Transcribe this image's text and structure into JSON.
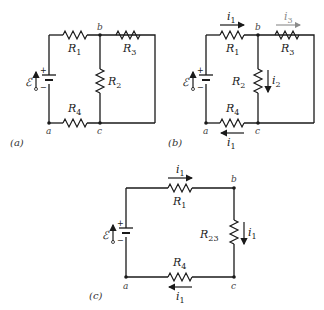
{
  "figures": [
    {
      "caption": "(a)",
      "nodes": [
        "a",
        "b",
        "c"
      ],
      "emf_label": "ℰ",
      "battery_signs": [
        "+",
        "−"
      ],
      "resistors": [
        {
          "name": "R",
          "sub": "1"
        },
        {
          "name": "R",
          "sub": "2"
        },
        {
          "name": "R",
          "sub": "3"
        },
        {
          "name": "R",
          "sub": "4"
        }
      ]
    },
    {
      "caption": "(b)",
      "nodes": [
        "a",
        "b",
        "c"
      ],
      "emf_label": "ℰ",
      "battery_signs": [
        "+",
        "−"
      ],
      "resistors": [
        {
          "name": "R",
          "sub": "1"
        },
        {
          "name": "R",
          "sub": "2"
        },
        {
          "name": "R",
          "sub": "3"
        },
        {
          "name": "R",
          "sub": "4"
        }
      ],
      "currents": [
        {
          "name": "i",
          "sub": "1",
          "location": "through R1, rightward"
        },
        {
          "name": "i",
          "sub": "2",
          "location": "through R2, downward"
        },
        {
          "name": "i",
          "sub": "3",
          "location": "through R3, rightward"
        },
        {
          "name": "i",
          "sub": "1",
          "location": "through R4, leftward"
        }
      ]
    },
    {
      "caption": "(c)",
      "nodes": [
        "a",
        "b",
        "c"
      ],
      "emf_label": "ℰ",
      "battery_signs": [
        "+",
        "−"
      ],
      "resistors": [
        {
          "name": "R",
          "sub": "1"
        },
        {
          "name": "R",
          "sub": "23"
        },
        {
          "name": "R",
          "sub": "4"
        }
      ],
      "currents": [
        {
          "name": "i",
          "sub": "1",
          "location": "through R1, rightward"
        },
        {
          "name": "i",
          "sub": "1",
          "location": "through R23, downward"
        },
        {
          "name": "i",
          "sub": "1",
          "location": "through R4, leftward"
        }
      ]
    }
  ]
}
